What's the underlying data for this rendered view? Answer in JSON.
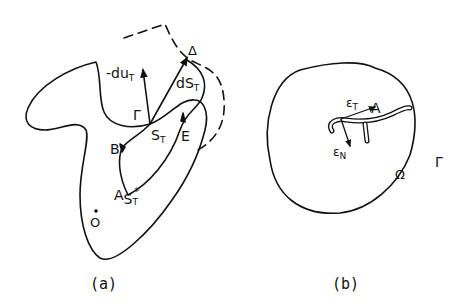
{
  "figure_a": {
    "caption": "(a)",
    "labels": {
      "neg_du": "-du",
      "neg_du_sub": "T",
      "dS": "dS",
      "dS_sub": "T",
      "Delta": "Δ",
      "Gamma": "Γ",
      "S": "S",
      "S_sub": "T",
      "E": "E",
      "B": "B",
      "A": "A",
      "S_star": "S",
      "S_star_sub": "T",
      "S_star_sup": "*",
      "O": "O"
    }
  },
  "figure_b": {
    "caption": "(b)",
    "labels": {
      "eps_T": "ε",
      "eps_T_sub": "T",
      "A": "A",
      "eps_N": "ε",
      "eps_N_sub": "N",
      "Omega": "Ω",
      "Gamma": "Γ"
    }
  },
  "colors": {
    "ink": "#111111",
    "background": "#ffffff"
  }
}
